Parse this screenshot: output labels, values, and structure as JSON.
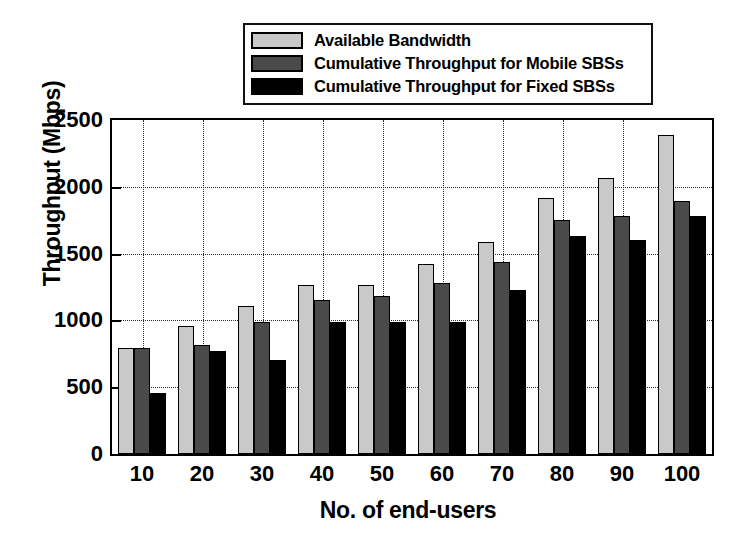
{
  "chart_data": {
    "type": "bar",
    "title": "",
    "xlabel": "No. of end-users",
    "ylabel": "Throughput (Mbps)",
    "categories": [
      "10",
      "20",
      "30",
      "40",
      "50",
      "60",
      "70",
      "80",
      "90",
      "100"
    ],
    "ylim": [
      0,
      2500
    ],
    "yticks": [
      0,
      500,
      1000,
      1500,
      2000,
      2500
    ],
    "ytick_labels": [
      "0",
      "500",
      "1000",
      "1500",
      "2000",
      "2500"
    ],
    "grid": true,
    "legend_position": "top-center-outside",
    "series": [
      {
        "name": "Available Bandwidth",
        "color": "#c9c9c9",
        "values": [
          790,
          955,
          1110,
          1265,
          1265,
          1425,
          1585,
          1915,
          2065,
          2390
        ]
      },
      {
        "name": "Cumulative Throughput for Mobile SBSs",
        "color": "#4a4a4a",
        "values": [
          790,
          815,
          990,
          1155,
          1180,
          1280,
          1440,
          1750,
          1785,
          1895
        ]
      },
      {
        "name": "Cumulative Throughput for Fixed SBSs",
        "color": "#000000",
        "values": [
          460,
          770,
          700,
          985,
          990,
          990,
          1230,
          1635,
          1605,
          1780
        ]
      }
    ]
  }
}
